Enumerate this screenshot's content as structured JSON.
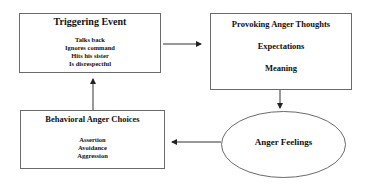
{
  "diagram": {
    "triggering_event": {
      "title": "Triggering Event",
      "items": [
        "Talks back",
        "Ignores command",
        "Hits his sister",
        "Is disrespectful"
      ]
    },
    "provoking_thoughts": {
      "title": "Provoking Anger Thoughts",
      "items": [
        "Expectations",
        "Meaning"
      ]
    },
    "anger_feelings": {
      "title": "Anger Feelings"
    },
    "behavioral_choices": {
      "title": "Behavioral Anger Choices",
      "items": [
        "Assertion",
        "Avoidance",
        "Aggression"
      ]
    },
    "colors": {
      "border": "#6a6a6a",
      "arrow": "#222222",
      "text": "#111111"
    }
  }
}
